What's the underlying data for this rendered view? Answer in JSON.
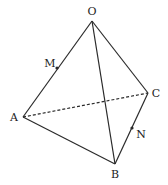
{
  "diagram": {
    "type": "tetrahedron",
    "stroke_color": "#2a2a2a",
    "vertices": {
      "O": {
        "label": "O",
        "x": 92,
        "y": 21,
        "lx": 92,
        "ly": 15
      },
      "A": {
        "label": "A",
        "x": 23,
        "y": 117,
        "lx": 14,
        "ly": 121
      },
      "B": {
        "label": "B",
        "x": 115,
        "y": 164,
        "lx": 115,
        "ly": 178
      },
      "C": {
        "label": "C",
        "x": 148,
        "y": 93,
        "lx": 156,
        "ly": 97
      }
    },
    "points": {
      "M": {
        "label": "M",
        "x": 57,
        "y": 68,
        "lx": 50,
        "ly": 67,
        "on_edge": "OA"
      },
      "N": {
        "label": "N",
        "x": 132,
        "y": 128,
        "lx": 141,
        "ly": 138,
        "on_edge": "BC"
      }
    },
    "edges": [
      {
        "from": "O",
        "to": "A",
        "style": "solid"
      },
      {
        "from": "O",
        "to": "B",
        "style": "solid"
      },
      {
        "from": "O",
        "to": "C",
        "style": "solid"
      },
      {
        "from": "A",
        "to": "B",
        "style": "solid"
      },
      {
        "from": "B",
        "to": "C",
        "style": "solid"
      },
      {
        "from": "A",
        "to": "C",
        "style": "dashed"
      }
    ]
  }
}
